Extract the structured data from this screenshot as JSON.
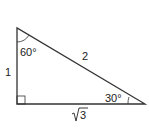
{
  "diagram": {
    "type": "right-triangle",
    "stroke_color": "#333333",
    "labels": {
      "top_angle": "60°",
      "right_angle_mark": "right-angle",
      "bottom_right_angle": "30°",
      "left_side": "1",
      "hypotenuse": "2",
      "bottom_side_radicand": "3",
      "bottom_side_radical": "√"
    }
  }
}
